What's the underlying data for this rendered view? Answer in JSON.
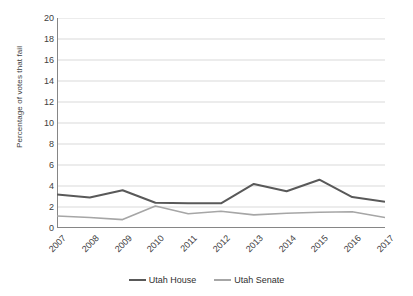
{
  "chart_data": {
    "type": "line",
    "title": "",
    "xlabel": "",
    "ylabel": "Percentage of votes that fail",
    "categories": [
      "2007",
      "2008",
      "2009",
      "2010",
      "2011",
      "2012",
      "2013",
      "2014",
      "2015",
      "2016",
      "2017"
    ],
    "series": [
      {
        "name": "Utah House",
        "color": "#595959",
        "values": [
          3.2,
          2.9,
          3.6,
          2.4,
          2.35,
          2.35,
          4.2,
          3.5,
          4.6,
          2.95,
          2.5
        ]
      },
      {
        "name": "Utah Senate",
        "color": "#a6a6a6",
        "values": [
          1.15,
          1.0,
          0.8,
          2.1,
          1.35,
          1.6,
          1.25,
          1.4,
          1.5,
          1.55,
          1.0
        ]
      }
    ],
    "ylim": [
      0,
      20
    ],
    "ytick_values": [
      "20",
      "18",
      "16",
      "14",
      "12",
      "10",
      "8",
      "6",
      "4",
      "2",
      "0"
    ],
    "ytick_step": 2,
    "grid": true,
    "grid_color": "#d9d9d9",
    "axis_color": "#868686",
    "legend_position": "bottom",
    "plot_background": "#ffffff"
  }
}
